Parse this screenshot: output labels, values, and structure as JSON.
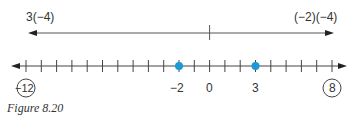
{
  "figure": {
    "caption": "Figure 8.20",
    "colors": {
      "line": "#555555",
      "axis": "#444444",
      "point": "#1a9ad6",
      "text": "#333333"
    },
    "top_arrow": {
      "left_label": "3(−4)",
      "right_label": "(−2)(−4)",
      "center_mark_value": 0
    },
    "number_line": {
      "min": -12,
      "max": 8,
      "tick_step": 1,
      "arrows": "both",
      "labels": [
        {
          "value": -2,
          "text": "−2"
        },
        {
          "value": 0,
          "text": "0"
        },
        {
          "value": 3,
          "text": "3"
        }
      ],
      "circled_labels": [
        {
          "value": -12,
          "text": "−12"
        },
        {
          "value": 8,
          "text": "8"
        }
      ],
      "points": [
        {
          "value": -2
        },
        {
          "value": 3
        }
      ]
    }
  }
}
